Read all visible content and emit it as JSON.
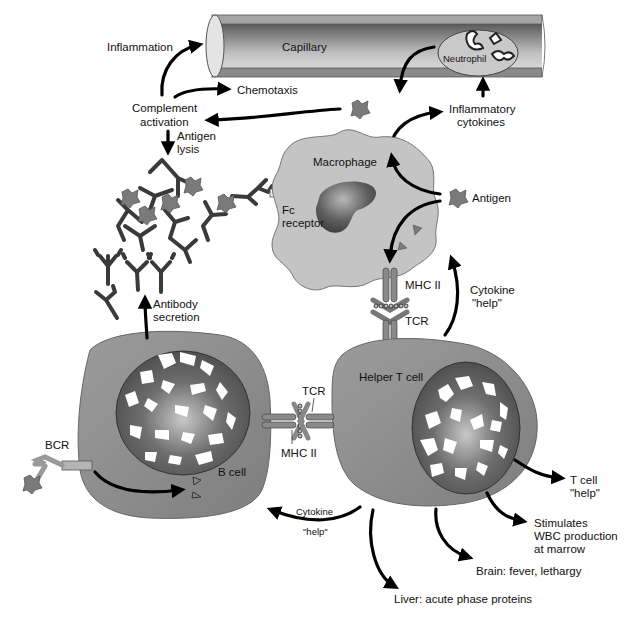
{
  "colors": {
    "background": "#ffffff",
    "cell_fill": "#8f8f8f",
    "macrophage_fill": "#c4c4c4",
    "nucleus_fill": "#5a5a5a",
    "antigen_fill": "#7a7a7a",
    "arrow": "#000000"
  },
  "capillary": {
    "label": "Capillary",
    "neutrophil_label": "Neutrophil"
  },
  "labels": {
    "inflammation": "Inflammation",
    "chemotaxis": "Chemotaxis",
    "complement_activation": [
      "Complement",
      "activation"
    ],
    "antigen_lysis": [
      "Antigen",
      "lysis"
    ],
    "inflammatory_cytokines": [
      "Inflammatory",
      "cytokines"
    ],
    "macrophage": "Macrophage",
    "fc_receptor": [
      "Fc",
      "receptor"
    ],
    "antigen": "Antigen",
    "mhc_ii_top": "MHC II",
    "tcr_top": "TCR",
    "cytokine_help_up": [
      "Cytokine",
      "\"help\""
    ],
    "antibody_secretion": [
      "Antibody",
      "secretion"
    ],
    "helper_t_cell": "Helper T cell",
    "b_cell": "B cell",
    "bcr": "BCR",
    "tcr_mid": "TCR",
    "mhc_ii_mid": "MHC II",
    "cytokine_help_left": [
      "Cytokine",
      "\"help\""
    ],
    "t_cell_help": [
      "T cell",
      "\"help\""
    ],
    "stimulates_wbc": [
      "Stimulates",
      "WBC production",
      "at marrow"
    ],
    "brain": "Brain: fever, lethargy",
    "liver": "Liver: acute phase proteins"
  }
}
